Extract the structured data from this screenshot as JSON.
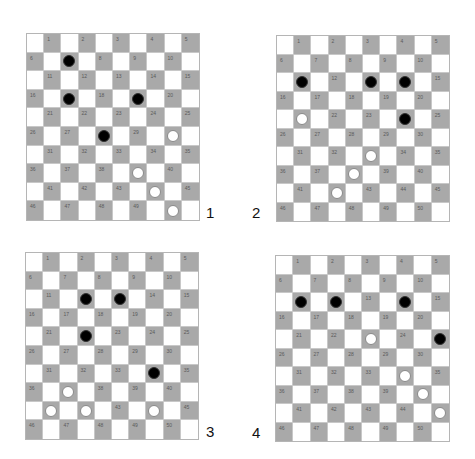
{
  "colors": {
    "dark_square": "#a9a9a9",
    "light_square": "#ffffff",
    "black_piece": "#000000",
    "white_piece": "#ffffff",
    "number_text": "#5a5a5a"
  },
  "boards": [
    {
      "label": "1",
      "black": [
        7,
        17,
        19,
        28
      ],
      "white": [
        30,
        39,
        44,
        50
      ]
    },
    {
      "label": "2",
      "black": [
        11,
        13,
        14,
        24
      ],
      "white": [
        21,
        33,
        38,
        42
      ]
    },
    {
      "label": "3",
      "black": [
        12,
        13,
        22,
        34
      ],
      "white": [
        37,
        41,
        42,
        44
      ]
    },
    {
      "label": "4",
      "black": [
        11,
        12,
        14,
        25
      ],
      "white": [
        23,
        34,
        40,
        45
      ]
    }
  ],
  "square_numbers": [
    1,
    2,
    3,
    4,
    5,
    6,
    7,
    8,
    9,
    10,
    11,
    12,
    13,
    14,
    15,
    16,
    17,
    18,
    19,
    20,
    21,
    22,
    23,
    24,
    25,
    26,
    27,
    28,
    29,
    30,
    31,
    32,
    33,
    34,
    35,
    36,
    37,
    38,
    39,
    40,
    41,
    42,
    43,
    44,
    45,
    46,
    47,
    48,
    49,
    50
  ]
}
